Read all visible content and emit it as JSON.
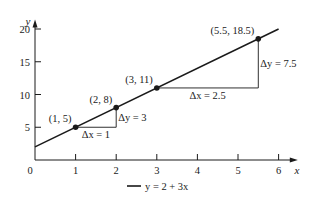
{
  "chart_data": {
    "type": "line",
    "title": "",
    "xlabel": "x",
    "ylabel": "y",
    "xlim": [
      0,
      6.4
    ],
    "ylim": [
      0,
      21
    ],
    "x_ticks": [
      1,
      2,
      3,
      4,
      5,
      6
    ],
    "y_ticks": [
      5,
      10,
      15,
      20
    ],
    "origin_label": "0",
    "grid": false,
    "series": [
      {
        "name": "y = 2 + 3x",
        "equation": {
          "intercept": 2,
          "slope": 3
        },
        "x_range": [
          0,
          6
        ],
        "color": "#1a1a1a"
      }
    ],
    "points": [
      {
        "x": 1,
        "y": 5,
        "label": "(1, 5)"
      },
      {
        "x": 2,
        "y": 8,
        "label": "(2, 8)"
      },
      {
        "x": 3,
        "y": 11,
        "label": "(3, 11)"
      },
      {
        "x": 5.5,
        "y": 18.5,
        "label": "(5.5, 18.5)"
      }
    ],
    "annotations": [
      {
        "type": "delta-x",
        "from": [
          1,
          5
        ],
        "to": [
          2,
          5
        ],
        "label": "Δx = 1"
      },
      {
        "type": "delta-y",
        "from": [
          2,
          5
        ],
        "to": [
          2,
          8
        ],
        "label": "Δy = 3"
      },
      {
        "type": "delta-x",
        "from": [
          3,
          11
        ],
        "to": [
          5.5,
          11
        ],
        "label": "Δx = 2.5"
      },
      {
        "type": "delta-y",
        "from": [
          5.5,
          11
        ],
        "to": [
          5.5,
          18.5
        ],
        "label": "Δy = 7.5"
      }
    ],
    "legend": {
      "entries": [
        "y = 2 + 3x"
      ],
      "position": "bottom-center"
    }
  }
}
